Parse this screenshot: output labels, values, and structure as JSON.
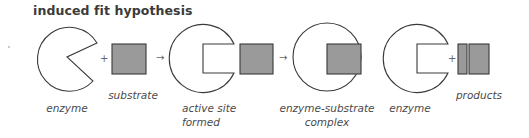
{
  "title": "induced fit hypothesis",
  "colors": {
    "outline": "#3a3a3a",
    "fill_shape": "#9a9a9a",
    "enzyme_fill": "#ffffff",
    "text": "#4a4a4a"
  },
  "steps": [
    {
      "id": "enzyme",
      "label_lines": [
        "enzyme"
      ]
    },
    {
      "id": "substrate",
      "label_lines": [
        "substrate"
      ]
    },
    {
      "id": "active-site-formed",
      "label_lines": [
        "active site",
        "formed"
      ]
    },
    {
      "id": "enzyme-substrate-complex",
      "label_lines": [
        "enzyme-substrate",
        "complex"
      ]
    },
    {
      "id": "enzyme-after",
      "label_lines": [
        "enzyme"
      ]
    },
    {
      "id": "products",
      "label_lines": [
        "products"
      ]
    }
  ],
  "symbols": {
    "plus": "+",
    "arrow": "→"
  }
}
